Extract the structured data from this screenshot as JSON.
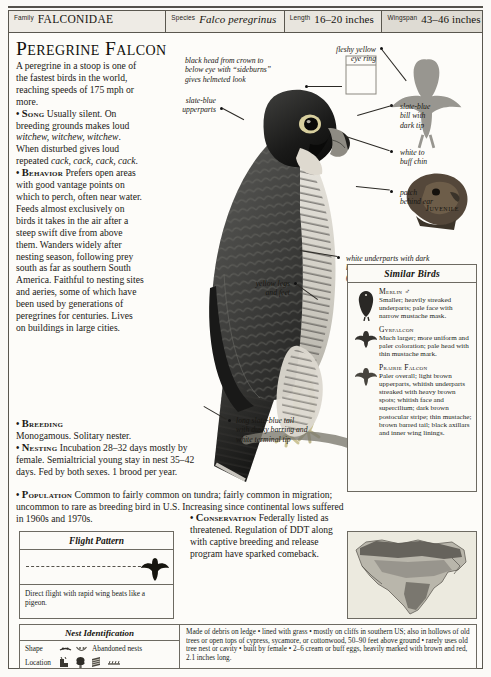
{
  "header": {
    "fields": [
      {
        "label": "Family",
        "value": "FALCONIDAE",
        "style": "smallcaps"
      },
      {
        "label": "Species",
        "value": "Falco peregrinus",
        "style": "italic"
      },
      {
        "label": "Length",
        "value": "16–20 inches",
        "style": "plain"
      },
      {
        "label": "Wingspan",
        "value": "43–46 inches",
        "style": "plain"
      }
    ]
  },
  "page_title": "Peregrine Falcon",
  "intro": "A peregrine in a stoop is one of the fastest birds in the world, reaching speeds of 175 mph or more.",
  "sections": {
    "song_label": "Song",
    "song_text_1": "Usually silent. On breeding grounds makes loud ",
    "song_call_1": "witchew, witchew, witchew",
    "song_text_2": ". When disturbed gives loud repeated ",
    "song_call_2": "cack, cack, cack, cack",
    "song_text_3": ".",
    "behavior_label": "Behavior",
    "behavior_text": "Prefers open areas with good vantage points on which to perch, often near water. Feeds almost exclusively on birds it takes in the air after a steep swift dive from above them. Wanders widely after nesting season, following prey south as far as southern South America. Faithful to nesting sites and aeries, some of which have been used by generations of peregrines for centuries. Lives on buildings in large cities.",
    "breeding_label": "Breeding",
    "breeding_text": "Monogamous. Solitary nester.",
    "nesting_label": "Nesting",
    "nesting_text": "Incubation 28–32 days mostly by female. Semialtricial young stay in nest 35–42 days. Fed by both sexes. 1 brood per year.",
    "population_label": "Population",
    "population_text": "Common to fairly common on tundra; fairly common in migration; uncommon to rare as breeding bird in U.S. Increasing since continental lows suffered in 1960s and 1970s.",
    "conservation_label": "Conservation",
    "conservation_text": "Federally listed as threatened. Regulation of DDT along with captive breeding and release program have sparked comeback."
  },
  "callouts": [
    {
      "id": "head",
      "text": "black head from crown to\nbelow eye with “sideburns”\ngives helmeted look"
    },
    {
      "id": "eye-ring",
      "text": "fleshy yellow\neye ring"
    },
    {
      "id": "bill",
      "text": "slate-blue\nbill with\ndark tip"
    },
    {
      "id": "upperparts",
      "text": "slate-blue\nupperparts"
    },
    {
      "id": "chin",
      "text": "white to\nbuff chin"
    },
    {
      "id": "ear-patch",
      "text": "patch\nbehind ear"
    },
    {
      "id": "underparts",
      "text": "white underparts with dark\nbrown to black barring\n(except throat and chin)"
    },
    {
      "id": "legs",
      "text": "yellow legs\nand feet"
    },
    {
      "id": "tail",
      "text": "long slate-blue tail\nwith dusky barring and\nwhite terminal tip"
    }
  ],
  "juvenile_label": "Juvenile",
  "similar_birds": {
    "title": "Similar Birds",
    "items": [
      {
        "name": "Merlin ♂",
        "desc": "Smaller; heavily streaked underparts; pale face with narrow mustache mask."
      },
      {
        "name": "Gyrfalcon",
        "desc": "Much larger; more uniform and paler coloration; pale head with thin mustache mark."
      },
      {
        "name": "Prairie Falcon",
        "desc": "Paler overall; light brown upperparts, whitish underparts streaked with heavy brown spots; whitish face and supercilium; dark brown postocular stripe; thin mustache; brown barred tail; black axillars and inner wing linings."
      }
    ]
  },
  "flight_pattern": {
    "title": "Flight Pattern",
    "caption": "Direct flight with rapid wing beats like a pigeon."
  },
  "nest_identification": {
    "title": "Nest Identification",
    "shape_label": "Shape",
    "shape_value": "Abandoned nests",
    "location_label": "Location",
    "location_value": "",
    "description": "Made of debris on ledge • lined with grass • mostly on cliffs in southern US; also in hollows of old trees or open tops of cypress, sycamore, or cottonwood, 50–90 feet above ground • rarely uses old tree nest or cavity • built by female • 2–6 cream or buff eggs, heavily marked with brown and red, 2.1 inches long."
  },
  "colors": {
    "rule": "#55524c",
    "border": "#5a574f",
    "paper": "#fbfaf7",
    "text": "#1b1915",
    "map_range": "#8d8a83"
  }
}
